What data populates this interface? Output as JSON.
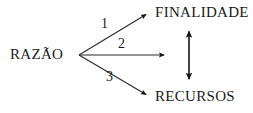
{
  "diagram": {
    "background_color": "#ffffff",
    "stroke_color": "#1a1a1a",
    "nodes": {
      "source": {
        "label": "RAZÃO"
      },
      "target_top": {
        "label": "FINALIDADE"
      },
      "target_bottom": {
        "label": "RECURSOS"
      }
    },
    "edge_labels": {
      "one": "1",
      "two": "2",
      "three": "3"
    },
    "edges": [
      {
        "name": "razao-to-finalidade",
        "label": "1",
        "from": "RAZÃO",
        "to": "FINALIDADE",
        "arrowheads": "end"
      },
      {
        "name": "razao-middle",
        "label": "2",
        "from": "RAZÃO",
        "to": "",
        "arrowheads": "end"
      },
      {
        "name": "razao-to-recursos",
        "label": "3",
        "from": "RAZÃO",
        "to": "RECURSOS",
        "arrowheads": "end"
      },
      {
        "name": "finalidade-recursos-link",
        "label": "",
        "from": "FINALIDADE",
        "to": "RECURSOS",
        "arrowheads": "both"
      }
    ]
  }
}
